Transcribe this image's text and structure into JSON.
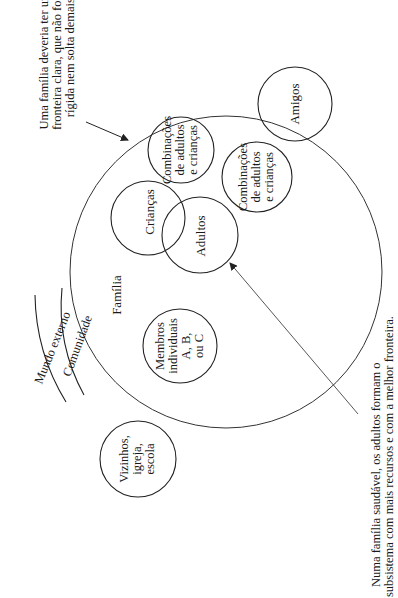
{
  "diagram": {
    "type": "family-systems-diagram",
    "orientation": "rotated-90-ccw",
    "annotations": {
      "top": {
        "lines": [
          "Uma família deveria ter uma",
          "fronteira clara, que não fosse",
          "rígida nem solta demais"
        ]
      },
      "bottom": {
        "lines": [
          "Numa família saudável, os adultos formam o",
          "subsistema com mais recursos e com a melhor fronteira."
        ]
      }
    },
    "arcs": {
      "outer": "Mundo externo",
      "middle": "Comunidade"
    },
    "family_label": "Família",
    "circles": [
      {
        "id": "amigos",
        "lines": [
          "Amigos"
        ]
      },
      {
        "id": "combinacoes-1",
        "lines": [
          "Combinações",
          "de adultos",
          "e crianças"
        ]
      },
      {
        "id": "combinacoes-2",
        "lines": [
          "Combinações",
          "de adultos",
          "e crianças"
        ]
      },
      {
        "id": "criancas",
        "lines": [
          "Crianças"
        ]
      },
      {
        "id": "adultos",
        "lines": [
          "Adultos"
        ]
      },
      {
        "id": "membros",
        "lines": [
          "Membros",
          "individuais",
          "A, B,",
          "ou C"
        ]
      },
      {
        "id": "vizinhos",
        "lines": [
          "Vizinhos,",
          "igreja,",
          "escola"
        ]
      }
    ],
    "colors": {
      "line": "#222222",
      "background": "#ffffff"
    }
  }
}
